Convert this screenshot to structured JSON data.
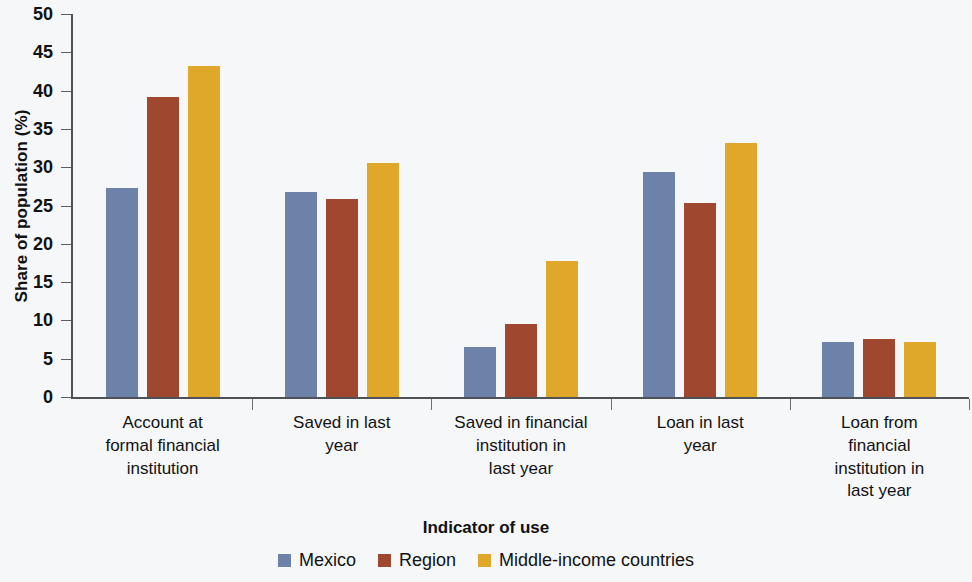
{
  "chart_data": {
    "type": "bar",
    "title": "",
    "xlabel": "Indicator of use",
    "ylabel": "Share of population (%)",
    "ylim": [
      0,
      50
    ],
    "ytick_step": 5,
    "yticks": [
      0,
      5,
      10,
      15,
      20,
      25,
      30,
      35,
      40,
      45,
      50
    ],
    "grid": false,
    "legend_position": "bottom",
    "categories": [
      "Account at formal financial institution",
      "Saved in last year",
      "Saved in financial institution in last year",
      "Loan in last year",
      "Loan from financial institution in last year"
    ],
    "category_lines": [
      [
        "Account at",
        "formal financial",
        "institution"
      ],
      [
        "Saved in last",
        "year"
      ],
      [
        "Saved in financial",
        "institution in",
        "last year"
      ],
      [
        "Loan in last",
        "year"
      ],
      [
        "Loan from",
        "financial",
        "institution in",
        "last year"
      ]
    ],
    "series": [
      {
        "name": "Mexico",
        "color": "#6d82a9",
        "values": [
          27.3,
          26.8,
          6.5,
          29.4,
          7.2
        ]
      },
      {
        "name": "Region",
        "color": "#a0472f",
        "values": [
          39.2,
          25.8,
          9.5,
          25.3,
          7.6
        ]
      },
      {
        "name": "Middle-income countries",
        "color": "#e0a82a",
        "values": [
          43.2,
          30.6,
          17.7,
          33.2,
          7.2
        ]
      }
    ]
  },
  "axis": {
    "y_title": "Share of population (%)",
    "x_title": "Indicator of use",
    "y_ticks": [
      "0",
      "5",
      "10",
      "15",
      "20",
      "25",
      "30",
      "35",
      "40",
      "45",
      "50"
    ]
  },
  "legend": {
    "items": [
      {
        "label": "Mexico",
        "color": "#6d82a9"
      },
      {
        "label": "Region",
        "color": "#a0472f"
      },
      {
        "label": "Middle-income countries",
        "color": "#e0a82a"
      }
    ]
  },
  "colors": {
    "background": "#f6f7f8",
    "axis": "#4e5256",
    "text": "#111214",
    "mexico": "#6d82a9",
    "region": "#a0472f",
    "middle_income": "#e0a82a"
  }
}
